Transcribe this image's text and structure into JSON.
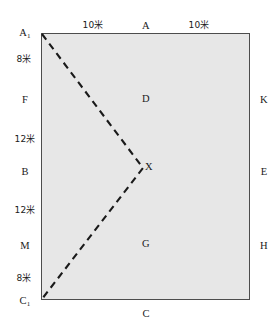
{
  "diagram": {
    "shape": "rectangle",
    "fill_color": "#e7e7e7",
    "border_color": "#4d4d4d",
    "dash_color": "#1a1a1a",
    "top_edge": {
      "segments": [
        {
          "name": "top-left-segment-length",
          "text": "10米"
        },
        {
          "name": "top-midpoint-label",
          "text": "A"
        },
        {
          "name": "top-right-segment-length",
          "text": "10米"
        }
      ]
    },
    "left_edge": {
      "corner_top": {
        "base": "A",
        "sub": "1"
      },
      "corner_bottom": {
        "base": "C",
        "sub": "1"
      },
      "items": [
        {
          "name": "left-length-8m-upper",
          "text": "8米",
          "kind": "length"
        },
        {
          "name": "left-point-F",
          "text": "F",
          "kind": "point"
        },
        {
          "name": "left-length-12m-upper",
          "text": "12米",
          "kind": "length"
        },
        {
          "name": "left-point-B",
          "text": "B",
          "kind": "point"
        },
        {
          "name": "left-length-12m-lower",
          "text": "12米",
          "kind": "length"
        },
        {
          "name": "left-point-M",
          "text": "M",
          "kind": "point"
        },
        {
          "name": "left-length-8m-lower",
          "text": "8米",
          "kind": "length"
        }
      ]
    },
    "right_edge": {
      "items": [
        {
          "name": "right-point-K",
          "text": "K"
        },
        {
          "name": "right-point-E",
          "text": "E"
        },
        {
          "name": "right-point-H",
          "text": "H"
        }
      ]
    },
    "bottom_edge": {
      "midpoint_label": {
        "name": "bottom-midpoint-label",
        "text": "C"
      }
    },
    "interior": {
      "region_upper": {
        "name": "region-label-D",
        "text": "D"
      },
      "vertex": {
        "name": "vertex-label-X",
        "text": "X"
      },
      "region_lower": {
        "name": "region-label-G",
        "text": "G"
      }
    }
  }
}
